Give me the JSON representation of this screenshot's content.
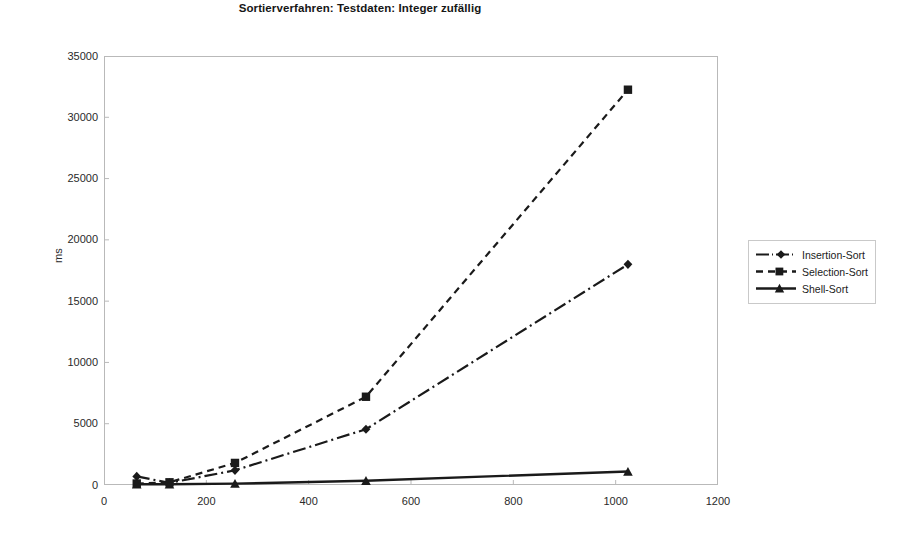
{
  "chart_data": {
    "type": "line",
    "title": "Sortierverfahren: Testdaten: Integer zufällig",
    "xlabel": "",
    "ylabel": "ms",
    "xlim": [
      0,
      1200
    ],
    "ylim": [
      0,
      35000
    ],
    "xticks": [
      0,
      200,
      400,
      600,
      800,
      1000,
      1200
    ],
    "yticks": [
      0,
      5000,
      10000,
      15000,
      20000,
      25000,
      30000,
      35000
    ],
    "grid": false,
    "legend_position": "right",
    "x": [
      64,
      128,
      256,
      512,
      1024
    ],
    "series": [
      {
        "name": "Insertion-Sort",
        "values": [
          700,
          170,
          1200,
          4550,
          18000
        ],
        "line_style": "dash-dot",
        "marker": "diamond",
        "color": "#1a1a1a"
      },
      {
        "name": "Selection-Sort",
        "values": [
          120,
          220,
          1800,
          7200,
          32250
        ],
        "line_style": "dashed",
        "marker": "square",
        "color": "#1a1a1a"
      },
      {
        "name": "Shell-Sort",
        "values": [
          60,
          60,
          110,
          350,
          1100
        ],
        "line_style": "solid",
        "marker": "triangle",
        "color": "#1a1a1a"
      }
    ]
  },
  "legend": {
    "items": [
      {
        "label": "Insertion-Sort"
      },
      {
        "label": "Selection-Sort"
      },
      {
        "label": "Shell-Sort"
      }
    ]
  },
  "axes": {
    "y_title": "ms",
    "y_tick_labels": [
      "35000",
      "30000",
      "25000",
      "20000",
      "15000",
      "10000",
      "5000",
      "0"
    ],
    "x_tick_labels": [
      "0",
      "200",
      "400",
      "600",
      "800",
      "1000",
      "1200"
    ]
  }
}
